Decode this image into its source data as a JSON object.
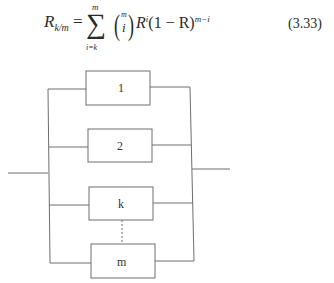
{
  "equation": {
    "lhs": "R",
    "lhs_sub": "k/m",
    "equals": "=",
    "sum_symbol": "∑",
    "sum_upper": "m",
    "sum_lower": "i=k",
    "binom_top": "m",
    "binom_bottom": "i",
    "paren_left": "(",
    "paren_right": ")",
    "term": "R",
    "term_sup": "i",
    "factor": "(1 − R)",
    "factor_sup": "m−i",
    "number": "(3.33)"
  },
  "diagram": {
    "type": "k-out-of-m parallel redundancy block diagram",
    "blocks": [
      {
        "label": "1"
      },
      {
        "label": "2"
      },
      {
        "label": "k"
      },
      {
        "label": "m"
      }
    ],
    "line_color": "#6e6e6e",
    "connector": "dashed line between k and m"
  }
}
